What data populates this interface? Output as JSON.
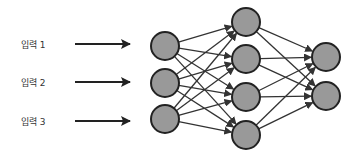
{
  "diagram": {
    "type": "neural-network",
    "colors": {
      "node_fill": "#999999",
      "node_stroke": "#222222",
      "edge": "#333333"
    },
    "inputs": [
      {
        "label": "입력 1",
        "y": 44
      },
      {
        "label": "입력 2",
        "y": 82
      },
      {
        "label": "입력 3",
        "y": 121
      }
    ],
    "layers": [
      {
        "name": "input-layer",
        "x": 165,
        "nodes": [
          46,
          83,
          119
        ]
      },
      {
        "name": "hidden-layer",
        "x": 246,
        "nodes": [
          22,
          59,
          97,
          135
        ]
      },
      {
        "name": "output-layer",
        "x": 326,
        "nodes": [
          57,
          96
        ]
      }
    ],
    "node_radius": 14
  }
}
